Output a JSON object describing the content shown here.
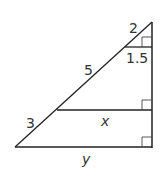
{
  "diagram": {
    "type": "similar right triangles",
    "labels": {
      "top_hyp": "2",
      "top_leg": "1.5",
      "mid_hyp": "5",
      "low_hyp": "3",
      "mid_base": "x",
      "bottom_base": "y"
    },
    "colors": {
      "stroke": "#222222",
      "text": "#333333"
    }
  }
}
